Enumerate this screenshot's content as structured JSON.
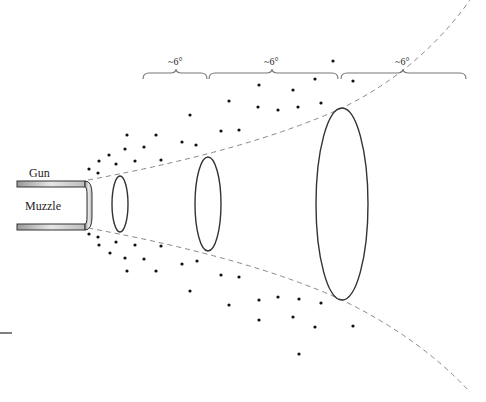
{
  "diagram": {
    "labels": {
      "gun": "Gun",
      "muzzle": "Muzzle"
    },
    "angle_brackets": [
      {
        "label": "~6°",
        "x1": 143,
        "x2": 207,
        "label_x": 176
      },
      {
        "label": "~6°",
        "x1": 209,
        "x2": 338,
        "label_x": 272
      },
      {
        "label": "~6°",
        "x1": 341,
        "x2": 466,
        "label_x": 403
      }
    ],
    "ellipses": [
      {
        "cx": 120,
        "cy": 204,
        "rx": 8,
        "ry": 28
      },
      {
        "cx": 208,
        "cy": 204,
        "rx": 13,
        "ry": 47
      },
      {
        "cx": 342,
        "cy": 204,
        "rx": 26,
        "ry": 96
      }
    ],
    "colors": {
      "stroke": "#333333",
      "dash": "#888888",
      "barrel_fill": "#cfcfcf",
      "dot": "#111111"
    }
  }
}
